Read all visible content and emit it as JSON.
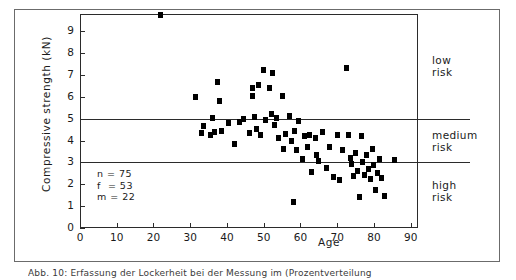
{
  "figure": {
    "caption": "Abb. 10: Erfassung der Lockerheit bei der Messung im (Prozentverteilung"
  },
  "chart_data": {
    "type": "scatter",
    "title": "",
    "xlabel": "Age",
    "ylabel": "Compressive strength  (kN)",
    "xlim": [
      0,
      92
    ],
    "ylim": [
      0,
      9.8
    ],
    "xticks": [
      0,
      10,
      20,
      30,
      40,
      50,
      60,
      70,
      80,
      90
    ],
    "yticks": [
      0,
      1,
      2,
      3,
      4,
      5,
      6,
      7,
      8,
      9
    ],
    "grid": false,
    "legend": "none",
    "marker": "filled-square",
    "marker_color": "#000000",
    "threshold_lines": [
      {
        "value": 5,
        "label": "low/medium boundary"
      },
      {
        "value": 3,
        "label": "medium/high boundary"
      }
    ],
    "bands": [
      {
        "label_line1": "low",
        "label_line2": "risk",
        "from": 5,
        "to": 9.8
      },
      {
        "label_line1": "medium",
        "label_line2": "risk",
        "from": 3,
        "to": 5
      },
      {
        "label_line1": "high",
        "label_line2": "risk",
        "from": 0.4,
        "to": 3
      }
    ],
    "annotation": [
      "n = 75",
      "f  = 53",
      "m = 22"
    ],
    "points": [
      [
        22.0,
        9.75
      ],
      [
        31.5,
        6.0
      ],
      [
        33.0,
        4.35
      ],
      [
        33.5,
        4.65
      ],
      [
        35.5,
        4.25
      ],
      [
        36.5,
        4.4
      ],
      [
        36.0,
        5.05
      ],
      [
        37.5,
        6.7
      ],
      [
        38.0,
        5.8
      ],
      [
        38.5,
        4.45
      ],
      [
        40.5,
        4.8
      ],
      [
        42.0,
        3.85
      ],
      [
        43.5,
        4.85
      ],
      [
        44.5,
        5.0
      ],
      [
        46.0,
        4.35
      ],
      [
        47.0,
        6.4
      ],
      [
        47.0,
        6.05
      ],
      [
        47.5,
        5.1
      ],
      [
        48.0,
        4.55
      ],
      [
        48.5,
        6.55
      ],
      [
        49.0,
        4.25
      ],
      [
        50.0,
        7.25
      ],
      [
        50.5,
        4.95
      ],
      [
        51.5,
        6.4
      ],
      [
        52.0,
        5.2
      ],
      [
        52.5,
        7.1
      ],
      [
        53.0,
        4.7
      ],
      [
        53.5,
        5.05
      ],
      [
        54.0,
        4.1
      ],
      [
        55.0,
        6.05
      ],
      [
        55.5,
        3.6
      ],
      [
        56.0,
        4.3
      ],
      [
        57.0,
        5.15
      ],
      [
        57.5,
        4.0
      ],
      [
        58.0,
        1.2
      ],
      [
        58.5,
        4.45
      ],
      [
        59.0,
        3.55
      ],
      [
        59.5,
        4.9
      ],
      [
        60.5,
        3.15
      ],
      [
        61.0,
        4.2
      ],
      [
        62.0,
        3.7
      ],
      [
        62.5,
        4.25
      ],
      [
        63.0,
        2.55
      ],
      [
        64.0,
        4.1
      ],
      [
        64.5,
        3.35
      ],
      [
        65.0,
        3.05
      ],
      [
        66.0,
        4.4
      ],
      [
        67.0,
        2.75
      ],
      [
        68.0,
        3.7
      ],
      [
        69.0,
        2.35
      ],
      [
        70.0,
        4.25
      ],
      [
        70.5,
        2.2
      ],
      [
        71.5,
        3.55
      ],
      [
        72.5,
        7.35
      ],
      [
        73.0,
        4.25
      ],
      [
        73.5,
        3.2
      ],
      [
        74.0,
        2.95
      ],
      [
        74.5,
        2.4
      ],
      [
        75.0,
        3.45
      ],
      [
        75.5,
        2.6
      ],
      [
        76.0,
        1.4
      ],
      [
        76.5,
        4.2
      ],
      [
        77.0,
        3.0
      ],
      [
        77.5,
        2.45
      ],
      [
        78.0,
        3.35
      ],
      [
        78.5,
        2.7
      ],
      [
        79.0,
        2.25
      ],
      [
        79.5,
        3.6
      ],
      [
        80.0,
        2.9
      ],
      [
        80.5,
        1.75
      ],
      [
        81.0,
        2.5
      ],
      [
        81.5,
        3.15
      ],
      [
        82.0,
        2.3
      ],
      [
        83.0,
        1.45
      ],
      [
        85.5,
        3.1
      ]
    ]
  }
}
